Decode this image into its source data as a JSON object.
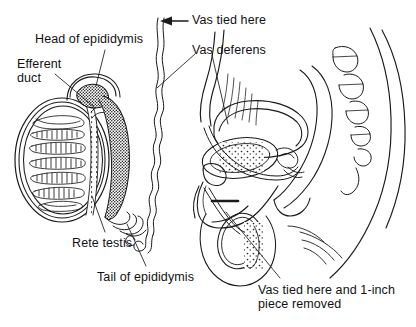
{
  "figure": {
    "background_color": "#ffffff",
    "ink_color": "#1a1a1a",
    "width": 416,
    "height": 327
  },
  "labels": {
    "head_of_epididymis": "Head of epididymis",
    "efferent_duct_line1": "Efferent",
    "efferent_duct_line2": "duct",
    "vas_tied_here": "Vas tied here",
    "vas_deferens": "Vas deferens",
    "rete_testis": "Rete testis",
    "tail_of_epididymis": "Tail of epididymis",
    "vas_tied_removed_line1": "Vas tied here and 1-inch",
    "vas_tied_removed_line2": "piece removed"
  },
  "icons": {
    "arrow_left": "arrow-left-icon",
    "ligature_marker": "ligature-marker-icon"
  },
  "anatomy_parts": [
    "testis-cross-section",
    "seminiferous-tubule-lobules",
    "rete-testis",
    "efferent-ducts",
    "head-of-epididymis",
    "body-of-epididymis",
    "tail-of-epididymis",
    "vas-deferens-coiled",
    "bladder",
    "prostate",
    "seminal-vesicle",
    "rectum",
    "sacrum-vertebrae",
    "penis",
    "scrotum-testis",
    "pubic-bone"
  ]
}
